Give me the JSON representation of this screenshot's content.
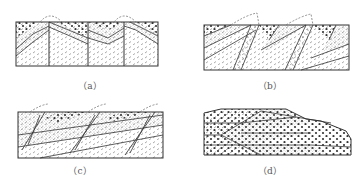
{
  "figure": {
    "panels": [
      {
        "id": "a",
        "label": "（a）",
        "type": "symmetric anticlines cut by vertical faults"
      },
      {
        "id": "b",
        "label": "（b）",
        "type": "inclined folds / thrust blocks"
      },
      {
        "id": "c",
        "label": "（c）",
        "type": "imbricate thrust slices"
      },
      {
        "id": "d",
        "label": "（d）",
        "type": "recumbent fold / nappe"
      }
    ],
    "legend_patterns": {
      "dots_large": "coarse dotted layer (conglomerate)",
      "dots_fine": "fine stippled layer (sandstone)",
      "dashes": "short dashed strokes (shale)"
    },
    "colors": {
      "line": "#333333",
      "pattern": "#555555",
      "dashed_restoration": "#777777"
    }
  }
}
